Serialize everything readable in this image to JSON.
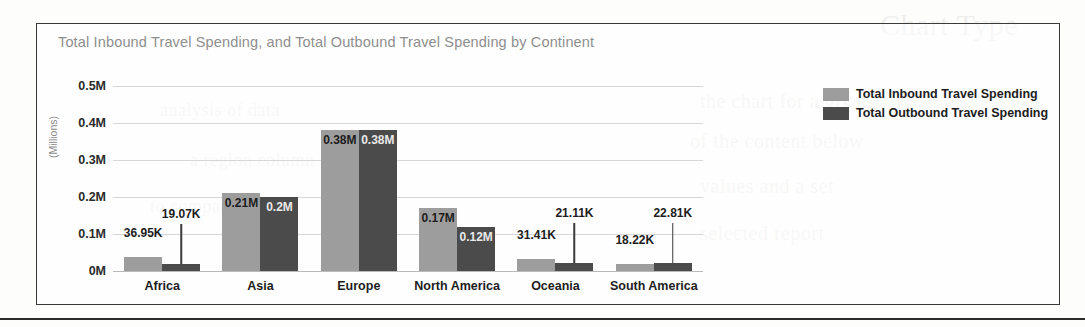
{
  "chart_data": {
    "type": "bar",
    "title": "Total Inbound Travel Spending, and Total Outbound Travel Spending by Continent",
    "xlabel": "",
    "ylabel": "(Millions)",
    "ylim": [
      0,
      0.5
    ],
    "grid": true,
    "legend_position": "right",
    "y_ticks": [
      "0M",
      "0.1M",
      "0.2M",
      "0.3M",
      "0.4M",
      "0.5M"
    ],
    "y_tick_values": [
      0,
      0.1,
      0.2,
      0.3,
      0.4,
      0.5
    ],
    "categories": [
      "Africa",
      "Asia",
      "Europe",
      "North America",
      "Oceania",
      "South America"
    ],
    "series": [
      {
        "name": "Total Inbound Travel Spending",
        "color": "#9d9d9d",
        "values": [
          0.03695,
          0.21,
          0.38,
          0.17,
          0.03141,
          0.01822
        ],
        "labels": [
          "36.95K",
          "0.21M",
          "0.38M",
          "0.17M",
          "31.41K",
          "18.22K"
        ]
      },
      {
        "name": "Total Outbound Travel Spending",
        "color": "#4b4b4b",
        "values": [
          0.01907,
          0.2,
          0.38,
          0.12,
          0.02111,
          0.02281
        ],
        "labels": [
          "19.07K",
          "0.2M",
          "0.38M",
          "0.12M",
          "21.11K",
          "22.81K"
        ]
      }
    ]
  },
  "legend": {
    "items": [
      {
        "label": "Total Inbound Travel Spending",
        "swatch": "inbound"
      },
      {
        "label": "Total Outbound Travel Spending",
        "swatch": "outbound"
      }
    ]
  },
  "colors": {
    "inbound": "#9d9d9d",
    "outbound": "#4b4b4b",
    "title": "#8e8e8e",
    "frame_border": "#3a3a3a",
    "gridline": "#d7d7d7"
  }
}
